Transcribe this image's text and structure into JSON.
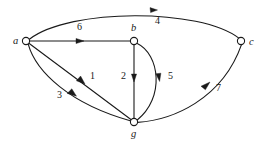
{
  "figure": {
    "kind": "directed-weighted-graph",
    "background_color": "#ffffff",
    "stroke_color": "#1a1a1a",
    "width": 265,
    "height": 144
  },
  "nodes": [
    {
      "id": "a",
      "label": "a",
      "cx": 26,
      "cy": 41,
      "r": 3.6,
      "label_x": 13,
      "label_y": 44
    },
    {
      "id": "b",
      "label": "b",
      "cx": 134,
      "cy": 41,
      "r": 3.6,
      "label_x": 131,
      "label_y": 31
    },
    {
      "id": "c",
      "label": "c",
      "cx": 241,
      "cy": 41,
      "r": 3.6,
      "label_x": 249,
      "label_y": 45
    },
    {
      "id": "g",
      "label": "g",
      "cx": 134,
      "cy": 122,
      "r": 3.6,
      "label_x": 131,
      "label_y": 137
    }
  ],
  "edges": [
    {
      "id": "a-c",
      "from": "a",
      "to": "c",
      "weight": "4",
      "label_x": 155,
      "label_y": 24,
      "shape": "curve-over-top"
    },
    {
      "id": "a-b",
      "from": "a",
      "to": "b",
      "weight": "6",
      "label_x": 77,
      "label_y": 30,
      "shape": "straight"
    },
    {
      "id": "a-g-1",
      "from": "a",
      "to": "g",
      "weight": "1",
      "label_x": 90,
      "label_y": 79,
      "shape": "straight"
    },
    {
      "id": "a-g-3",
      "from": "a",
      "to": "g",
      "weight": "3",
      "label_x": 57,
      "label_y": 98,
      "shape": "curve-below"
    },
    {
      "id": "b-g-2",
      "from": "b",
      "to": "g",
      "weight": "2",
      "label_x": 121,
      "label_y": 79,
      "shape": "straight-vertical"
    },
    {
      "id": "b-g-5",
      "from": "b",
      "to": "g",
      "weight": "5",
      "label_x": 168,
      "label_y": 79,
      "shape": "curve-right"
    },
    {
      "id": "g-c",
      "from": "g",
      "to": "c",
      "weight": "7",
      "label_x": 216,
      "label_y": 91,
      "shape": "curve-right-up"
    }
  ]
}
